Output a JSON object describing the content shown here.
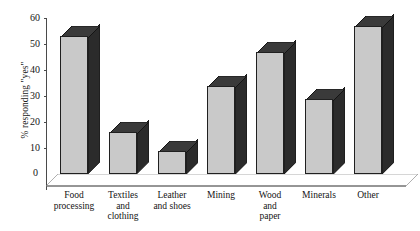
{
  "chart_data": {
    "type": "bar",
    "title": "",
    "subtitle": "",
    "xlabel": "",
    "ylabel": "% responding \"yes\"",
    "categories": [
      "Food processing",
      "Textiles and clothing",
      "Leather and shoes",
      "Mining",
      "Wood and paper",
      "Minerals",
      "Other"
    ],
    "category_lines": [
      [
        "Food",
        "processing"
      ],
      [
        "Textiles",
        "and",
        "clothing"
      ],
      [
        "Leather",
        "and shoes"
      ],
      [
        "Mining"
      ],
      [
        "Wood",
        "and",
        "paper"
      ],
      [
        "Minerals"
      ],
      [
        "Other"
      ]
    ],
    "values": [
      53,
      16,
      9,
      34,
      47,
      29,
      57
    ],
    "ylim": [
      0,
      60
    ],
    "yticks": [
      0,
      10,
      20,
      30,
      40,
      50,
      60
    ],
    "ytick_labels": [
      "0",
      "10",
      "20",
      "30",
      "40",
      "50",
      "60"
    ],
    "grid": false,
    "legend": false,
    "style": "3d-bar",
    "colors": {
      "bar_front": "#c9c9c9",
      "bar_side": "#2b2b2b",
      "bar_top": "#3a3a3a",
      "axis": "#4a4a4a",
      "text": "#131313",
      "background": "#ffffff"
    }
  }
}
